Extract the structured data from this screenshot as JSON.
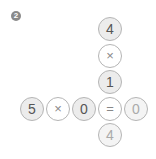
{
  "problem_number": "2",
  "vertical": [
    "4",
    "×",
    "1",
    "=",
    "4"
  ],
  "horizontal": [
    "5",
    "×",
    "0",
    "=",
    "0"
  ],
  "accent_color": "#b5b5b5"
}
